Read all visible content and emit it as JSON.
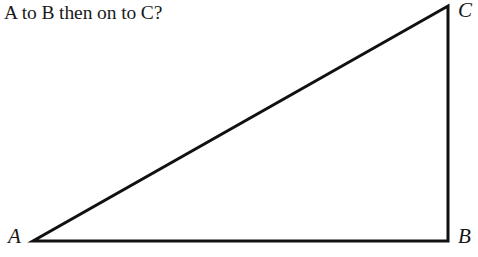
{
  "page": {
    "width": 478,
    "height": 257,
    "background_color": "#ffffff",
    "ink_color": "#111111"
  },
  "question": {
    "text": "A to B then on to C?"
  },
  "figure": {
    "type": "right-triangle-diagram",
    "stroke_color": "#111111",
    "stroke_width": 3,
    "fill": "none",
    "vertices": [
      {
        "name": "A",
        "label": "A",
        "x": 33,
        "y": 241,
        "label_x": 8,
        "label_y": 226,
        "corner": "bottom-left"
      },
      {
        "name": "B",
        "label": "B",
        "x": 448,
        "y": 241,
        "label_x": 458,
        "label_y": 226,
        "corner": "bottom-right"
      },
      {
        "name": "C",
        "label": "C",
        "x": 448,
        "y": 6,
        "label_x": 458,
        "label_y": 0,
        "corner": "top-right"
      }
    ],
    "edges": [
      {
        "name": "AB",
        "from": "A",
        "to": "B",
        "orientation": "horizontal"
      },
      {
        "name": "BC",
        "from": "B",
        "to": "C",
        "orientation": "vertical"
      },
      {
        "name": "CA",
        "from": "C",
        "to": "A",
        "orientation": "hypotenuse"
      }
    ]
  }
}
